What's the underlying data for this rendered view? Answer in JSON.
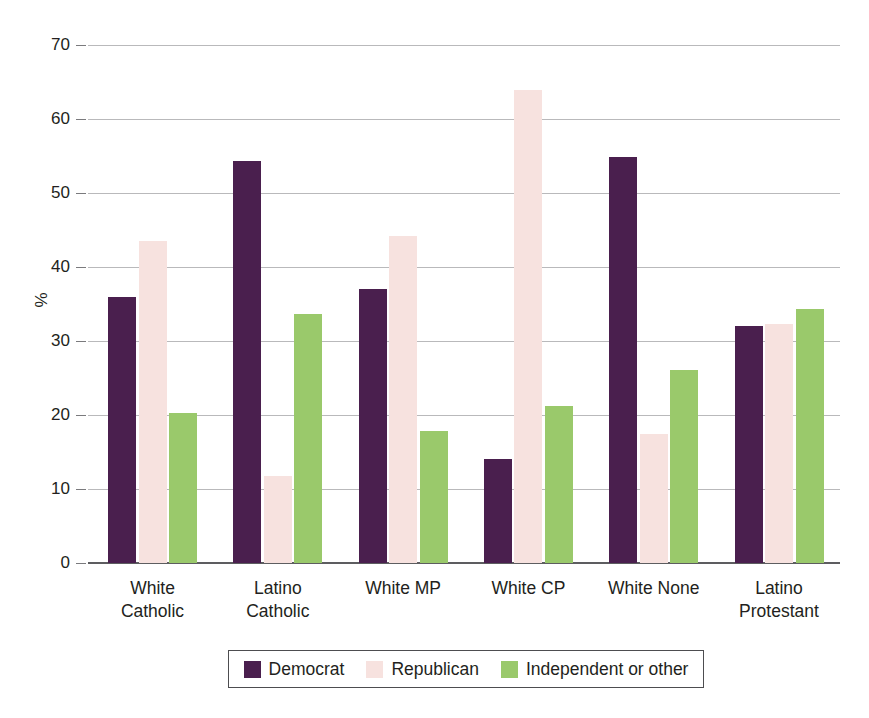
{
  "chart_data": {
    "type": "bar",
    "title": "",
    "subtitle": "",
    "xlabel": "",
    "ylabel": "%",
    "ylim": [
      0,
      70
    ],
    "ytick_values": [
      70,
      60,
      50,
      40,
      30,
      20,
      10,
      0
    ],
    "ytick_labels": [
      "70",
      "60",
      "50",
      "40",
      "30",
      "20",
      "10",
      "0"
    ],
    "grid": true,
    "legend_position": "bottom",
    "categories": [
      "White\nCatholic",
      "Latino\nCatholic",
      "White MP",
      "White CP",
      "White None",
      "Latino\nProtestant"
    ],
    "series": [
      {
        "name": "Democrat",
        "color": "#4a1f4e",
        "values": [
          36.0,
          54.3,
          37.0,
          14.0,
          54.8,
          32.0
        ]
      },
      {
        "name": "Republican",
        "color": "#f7e2df",
        "values": [
          43.5,
          11.7,
          44.2,
          63.9,
          17.5,
          32.3
        ]
      },
      {
        "name": "Independent or other",
        "color": "#9ac96b",
        "values": [
          20.3,
          33.7,
          17.8,
          21.2,
          26.1,
          34.3
        ]
      }
    ]
  },
  "legend": {
    "entries": [
      {
        "label": "Democrat",
        "color": "#4a1f4e"
      },
      {
        "label": "Republican",
        "color": "#f7e2df"
      },
      {
        "label": "Independent or other",
        "color": "#9ac96b"
      }
    ]
  },
  "axis": {
    "y_title": "%"
  }
}
